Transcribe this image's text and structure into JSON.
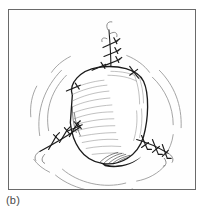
{
  "figure": {
    "caption": "(b)",
    "frame": {
      "border_color": "#6a6a6a",
      "background_color": "#fefefe"
    },
    "colors": {
      "ink": "#1b1b1b",
      "light_ink": "#6f6f6f",
      "hatch": "#8a8a8a",
      "tension_arc": "#9a9a9a",
      "caption": "#4a4a4a"
    },
    "illustration": {
      "type": "line-drawing",
      "subject": "island flap with sutured closure lines",
      "flap": {
        "name": "tissue-flap",
        "outline": "M 64 86 C 60 74, 72 61, 90 58 C 110 55, 130 60, 136 72 C 142 85, 141 110, 136 128 C 130 148, 112 158, 94 155 C 74 152, 64 134, 62 114 Z",
        "fill": "#ffffff",
        "stroke": "#1b1b1b"
      },
      "suture_lines": [
        {
          "name": "superior-suture-line",
          "orientation": "vertical",
          "path": "M 101 21 L 103 57",
          "stitch_count": 3,
          "stitches": [
            {
              "x": 102,
              "y": 34,
              "angle": -20
            },
            {
              "x": 102,
              "y": 43,
              "angle": -20
            },
            {
              "x": 103,
              "y": 52,
              "angle": -20
            }
          ]
        },
        {
          "name": "left-inferior-suture-line",
          "orientation": "diagonal",
          "path": "M 33 141 L 70 119",
          "stitch_count": 3,
          "stitches": [
            {
              "x": 44,
              "y": 134,
              "angle": 55
            },
            {
              "x": 54,
              "y": 128,
              "angle": 55
            },
            {
              "x": 63,
              "y": 122,
              "angle": 55
            }
          ]
        },
        {
          "name": "right-inferior-suture-line",
          "orientation": "diagonal",
          "path": "M 130 132 L 161 143",
          "stitch_count": 3,
          "stitches": [
            {
              "x": 137,
              "y": 134,
              "angle": -60
            },
            {
              "x": 146,
              "y": 137,
              "angle": -60
            },
            {
              "x": 155,
              "y": 141,
              "angle": -60
            }
          ]
        }
      ],
      "tension_arcs": {
        "name": "skin-tension-lines",
        "count": 10,
        "paths": [
          "M 40 122 C 36 100, 44 80, 58 66",
          "M 32 126 C 28 101, 38 78, 53 62",
          "M 145 68 C 158 80, 166 98, 166 116",
          "M 151 62 C 166 76, 174 96, 173 118",
          "M 54 160 C 70 174, 96 180, 118 174",
          "M 48 166 C 66 182, 98 188, 124 180",
          "M 128 172 C 140 170, 150 164, 157 156",
          "M 26 150 C 30 156, 36 160, 42 163",
          "M 60 48 C 52 52, 46 58, 42 64",
          "M 120 48 C 130 52, 138 58, 143 64"
        ]
      },
      "hatching": {
        "name": "flap-shading-hatching",
        "description": "fine cross-hatch texture along flap margins and base"
      }
    }
  }
}
